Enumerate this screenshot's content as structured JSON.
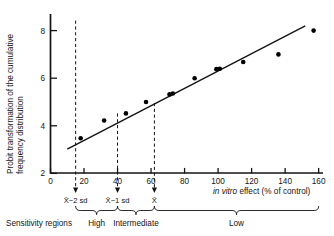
{
  "chart_data": {
    "type": "scatter",
    "title": "",
    "xlabel": "in vitro effect (% of control)",
    "xlabel_italic_part": "in vitro",
    "xlabel_rest": " effect (% of control)",
    "ylabel_line1": "Probit transformation of the cumulative",
    "ylabel_line2": "frequency distribution",
    "xlim": [
      0,
      162
    ],
    "ylim": [
      2,
      8.6
    ],
    "xticks": [
      0,
      20,
      40,
      60,
      80,
      100,
      120,
      140,
      160
    ],
    "yticks": [
      2,
      4,
      6,
      8
    ],
    "grid": false,
    "legend": "none",
    "points": [
      {
        "x": 18,
        "y": 3.48
      },
      {
        "x": 32,
        "y": 4.22
      },
      {
        "x": 45,
        "y": 4.52
      },
      {
        "x": 57,
        "y": 5.0
      },
      {
        "x": 71,
        "y": 5.32
      },
      {
        "x": 73,
        "y": 5.36
      },
      {
        "x": 86,
        "y": 6.0
      },
      {
        "x": 99,
        "y": 6.38
      },
      {
        "x": 101,
        "y": 6.4
      },
      {
        "x": 115,
        "y": 6.68
      },
      {
        "x": 136,
        "y": 7.0
      },
      {
        "x": 157,
        "y": 8.0
      }
    ],
    "fit_line": {
      "x0": 10,
      "y0": 3.02,
      "x1": 152,
      "y1": 8.2
    },
    "reference_lines": [
      {
        "x": 15,
        "label": "X̄−2 sd",
        "top_y": 8.42
      },
      {
        "x": 40,
        "label": "X̄−1 sd",
        "top_y": 4.52
      },
      {
        "x": 62,
        "label": "X̄",
        "top_y": 4.96
      }
    ]
  },
  "annotations": {
    "ref_labels": [
      "X̄−2 sd",
      "X̄−1 sd",
      "X̄"
    ],
    "regions_title": "Sensitivity regions",
    "regions": [
      {
        "label": "High",
        "from": 15,
        "to": 40
      },
      {
        "label": "Intermediate",
        "from": 40,
        "to": 62
      },
      {
        "label": "Low",
        "from": 62,
        "to": 160
      }
    ]
  },
  "axis": {
    "x_tick_labels": [
      "0",
      "20",
      "40",
      "60",
      "80",
      "100",
      "120",
      "140",
      "160"
    ],
    "y_tick_labels": [
      "2",
      "4",
      "6",
      "8"
    ],
    "x_title_italic": "in vitro",
    "x_title_plain": " effect (% of control)",
    "y_title_line1": "Probit transformation of the cumulative",
    "y_title_line2": "frequency distribution"
  },
  "colors": {
    "ink": "#141414",
    "point": "#000000",
    "background": "#ffffff"
  }
}
